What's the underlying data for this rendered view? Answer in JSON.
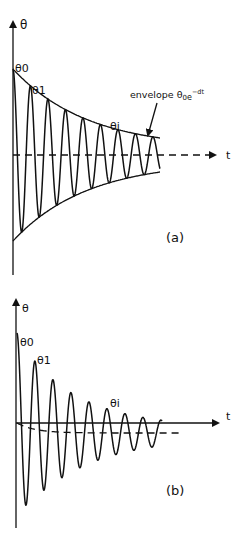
{
  "figure": {
    "panel_a": {
      "label": "(a)",
      "y_axis_label": "θ",
      "x_axis_label": "t",
      "peak_labels": [
        "θ0",
        "θ1",
        "θi"
      ],
      "envelope_text": "envelope θ",
      "envelope_sub": "0",
      "envelope_e": "e",
      "envelope_sup": "−dt",
      "description": "Damped oscillation about fixed equilibrium, bounded by exponential envelope"
    },
    "panel_b": {
      "label": "(b)",
      "y_axis_label": "θ",
      "x_axis_label": "t",
      "peak_labels": [
        "θ0",
        "θ1",
        "θi"
      ],
      "description": "Damped oscillation about a drifting (dashed) mean line"
    },
    "colors": {
      "ink": "#111111",
      "background": "#ffffff"
    }
  }
}
